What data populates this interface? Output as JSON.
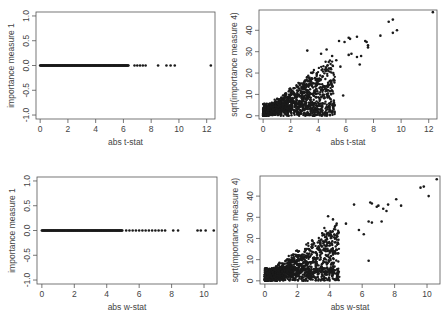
{
  "chart_data": [
    {
      "type": "scatter",
      "id": "top-left",
      "title": "",
      "xlabel": "abs t-stat",
      "ylabel": "importance  measure 1",
      "xlim": [
        -0.3,
        12.6
      ],
      "ylim": [
        -1.08,
        1.08
      ],
      "xticks": [
        0,
        2,
        4,
        6,
        8,
        10,
        12
      ],
      "yticks": [
        -1.0,
        -0.5,
        0.0,
        0.5,
        1.0
      ],
      "yticklabels": [
        "-1.0",
        "-0.5",
        "0.0",
        "0.5",
        "1.0"
      ],
      "grid": false,
      "dense_band": {
        "x_from": 0.0,
        "x_to": 6.4,
        "y": 0.0
      },
      "points": [
        [
          6.8,
          0
        ],
        [
          7.0,
          0
        ],
        [
          7.2,
          0
        ],
        [
          7.4,
          0
        ],
        [
          7.6,
          0
        ],
        [
          8.5,
          0
        ],
        [
          9.1,
          0
        ],
        [
          9.4,
          0
        ],
        [
          9.7,
          0
        ],
        [
          12.3,
          0
        ]
      ],
      "box": {
        "left": 36,
        "top": 12,
        "right": 215,
        "bottom": 119
      }
    },
    {
      "type": "scatter",
      "id": "top-right",
      "title": "",
      "xlabel": "abs t-stat",
      "ylabel": "sqrt(importance measure 4)",
      "xlim": [
        -0.3,
        12.6
      ],
      "ylim": [
        -1.5,
        49.5
      ],
      "xticks": [
        0,
        2,
        4,
        6,
        8,
        10,
        12
      ],
      "yticks": [
        0,
        10,
        20,
        30,
        40
      ],
      "yticklabels": [
        "0",
        "10",
        "20",
        "30",
        "40"
      ],
      "grid": false,
      "cloud": {
        "n": 1400,
        "x_max": 5.2,
        "slope": 4.2,
        "noise": 5.0
      },
      "points": [
        [
          3.2,
          30.5
        ],
        [
          4.2,
          29
        ],
        [
          5.0,
          28
        ],
        [
          5.5,
          35
        ],
        [
          5.9,
          34.5
        ],
        [
          6.2,
          36.5
        ],
        [
          6.3,
          36
        ],
        [
          6.2,
          28.5
        ],
        [
          6.4,
          29
        ],
        [
          6.8,
          37
        ],
        [
          6.8,
          27.5
        ],
        [
          7.0,
          24
        ],
        [
          7.1,
          28
        ],
        [
          7.4,
          35
        ],
        [
          7.5,
          34.5
        ],
        [
          7.6,
          33
        ],
        [
          7.6,
          32
        ],
        [
          8.5,
          37.5
        ],
        [
          9.1,
          44
        ],
        [
          9.4,
          45
        ],
        [
          9.4,
          38.8
        ],
        [
          9.7,
          40
        ],
        [
          12.3,
          48.5
        ],
        [
          5.8,
          9.5
        ],
        [
          4.6,
          31
        ],
        [
          5.3,
          26
        ],
        [
          5.6,
          23
        ]
      ],
      "box": {
        "left": 259,
        "top": 10,
        "right": 437,
        "bottom": 119
      }
    },
    {
      "type": "scatter",
      "id": "bottom-left",
      "title": "",
      "xlabel": "abs w-stat",
      "ylabel": "importance  measure 1",
      "xlim": [
        -0.3,
        10.8
      ],
      "ylim": [
        -1.08,
        1.08
      ],
      "xticks": [
        0,
        2,
        4,
        6,
        8,
        10
      ],
      "yticks": [
        -1.0,
        -0.5,
        0.0,
        0.5,
        1.0
      ],
      "yticklabels": [
        "-1.0",
        "-0.5",
        "0.0",
        "0.5",
        "1.0"
      ],
      "grid": false,
      "dense_band": {
        "x_from": 0.0,
        "x_to": 5.0,
        "y": 0.0
      },
      "points": [
        [
          5.2,
          0
        ],
        [
          5.4,
          0
        ],
        [
          5.6,
          0
        ],
        [
          5.8,
          0
        ],
        [
          6.0,
          0
        ],
        [
          6.2,
          0
        ],
        [
          6.4,
          0
        ],
        [
          6.6,
          0
        ],
        [
          6.8,
          0
        ],
        [
          7.0,
          0
        ],
        [
          7.2,
          0
        ],
        [
          7.4,
          0
        ],
        [
          7.6,
          0
        ],
        [
          8.1,
          0
        ],
        [
          8.4,
          0
        ],
        [
          9.6,
          0
        ],
        [
          9.8,
          0
        ],
        [
          10.1,
          0
        ],
        [
          10.6,
          0
        ]
      ],
      "box": {
        "left": 37,
        "top": 177,
        "right": 217,
        "bottom": 284
      }
    },
    {
      "type": "scatter",
      "id": "bottom-right",
      "title": "",
      "xlabel": "abs w-stat",
      "ylabel": "sqrt(importance measure 4)",
      "xlim": [
        -0.3,
        10.8
      ],
      "ylim": [
        -1.5,
        49.5
      ],
      "xticks": [
        0,
        2,
        4,
        6,
        8,
        10
      ],
      "yticks": [
        0,
        10,
        20,
        30,
        40
      ],
      "yticklabels": [
        "0",
        "10",
        "20",
        "30",
        "40"
      ],
      "grid": false,
      "cloud": {
        "n": 1400,
        "x_max": 4.6,
        "slope": 4.9,
        "noise": 5.0
      },
      "points": [
        [
          3.9,
          30.5
        ],
        [
          4.2,
          29
        ],
        [
          5.0,
          27
        ],
        [
          5.5,
          36
        ],
        [
          6.5,
          37
        ],
        [
          6.6,
          36.5
        ],
        [
          6.4,
          28
        ],
        [
          6.6,
          27.5
        ],
        [
          6.9,
          35
        ],
        [
          7.0,
          35.5
        ],
        [
          7.3,
          34
        ],
        [
          7.5,
          33
        ],
        [
          7.6,
          36
        ],
        [
          8.1,
          38.5
        ],
        [
          8.4,
          35.5
        ],
        [
          9.6,
          44
        ],
        [
          9.8,
          44.5
        ],
        [
          10.1,
          40
        ],
        [
          10.6,
          48
        ],
        [
          6.4,
          9.5
        ],
        [
          7.2,
          28
        ],
        [
          5.8,
          24
        ],
        [
          6.1,
          22
        ]
      ],
      "box": {
        "left": 260,
        "top": 176,
        "right": 440,
        "bottom": 284
      }
    }
  ]
}
